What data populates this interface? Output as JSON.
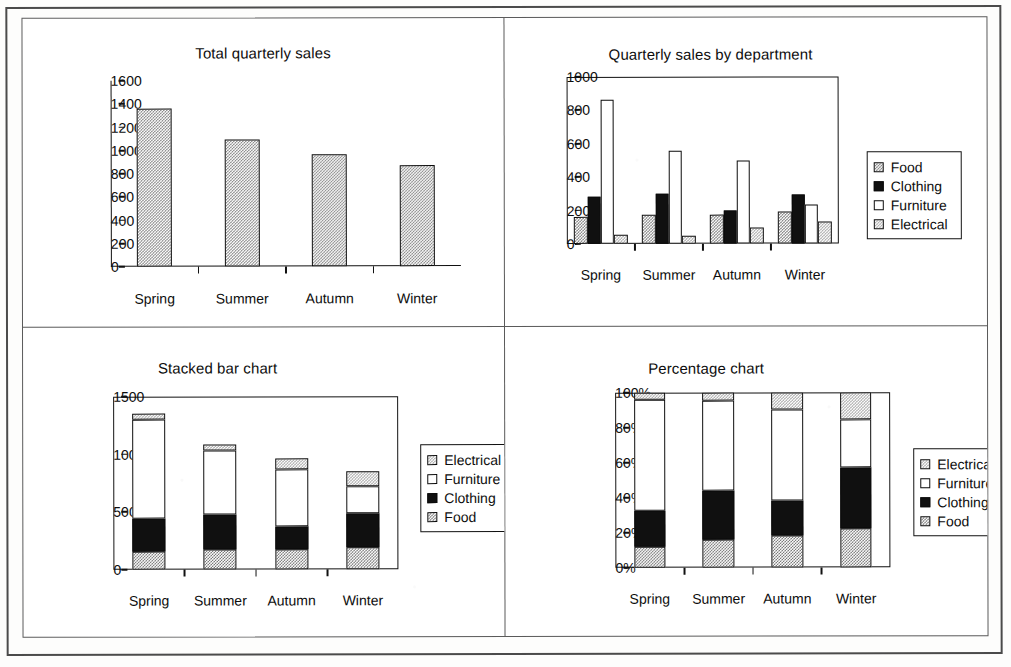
{
  "page": {
    "layout": "2x2 chart grid on scanned page",
    "categories": [
      "Spring",
      "Summer",
      "Autumn",
      "Winter"
    ],
    "series_names": [
      "Food",
      "Clothing",
      "Furniture",
      "Electrical"
    ],
    "colors": {
      "food": "#7a7a7a",
      "clothing": "#101010",
      "furniture": "#ffffff",
      "electrical": "#a8a8a8",
      "axis": "#111111",
      "frame": "#5a5a5a"
    }
  },
  "charts": {
    "total": {
      "title": "Total quarterly sales",
      "yticks": [
        "0",
        "200",
        "400",
        "600",
        "800",
        "1000",
        "1200",
        "1400",
        "1600"
      ],
      "xlabels": [
        "Spring",
        "Summer",
        "Autumn",
        "Winter"
      ]
    },
    "grouped": {
      "title": "Quarterly sales by department",
      "yticks": [
        "0",
        "200",
        "400",
        "600",
        "800",
        "1000"
      ],
      "xlabels": [
        "Spring",
        "Summer",
        "Autumn",
        "Winter"
      ],
      "legend": [
        "Food",
        "Clothing",
        "Furniture",
        "Electrical"
      ]
    },
    "stacked": {
      "title": "Stacked bar chart",
      "yticks": [
        "0",
        "500",
        "1000",
        "1500"
      ],
      "xlabels": [
        "Spring",
        "Summer",
        "Autumn",
        "Winter"
      ],
      "legend": [
        "Electrical",
        "Furniture",
        "Clothing",
        "Food"
      ]
    },
    "percentage": {
      "title": "Percentage chart",
      "yticks": [
        "0%",
        "20%",
        "40%",
        "60%",
        "80%",
        "100%"
      ],
      "xlabels": [
        "Spring",
        "Summer",
        "Autumn",
        "Winter"
      ],
      "legend": [
        "Electrical",
        "Furniture",
        "Clothing",
        "Food"
      ]
    }
  },
  "chart_data": [
    {
      "id": "total",
      "type": "bar",
      "title": "Total quarterly sales",
      "xlabel": "",
      "ylabel": "",
      "categories": [
        "Spring",
        "Summer",
        "Autumn",
        "Winter"
      ],
      "values": [
        1355,
        1090,
        965,
        865
      ],
      "ylim": [
        0,
        1600
      ],
      "ytick_step": 200,
      "grid": false,
      "legend": "none"
    },
    {
      "id": "grouped",
      "type": "bar",
      "title": "Quarterly sales by department",
      "xlabel": "",
      "ylabel": "",
      "categories": [
        "Spring",
        "Summer",
        "Autumn",
        "Winter"
      ],
      "series": [
        {
          "name": "Food",
          "values": [
            160,
            175,
            175,
            190
          ]
        },
        {
          "name": "Clothing",
          "values": [
            280,
            300,
            195,
            295
          ]
        },
        {
          "name": "Furniture",
          "values": [
            860,
            555,
            495,
            235
          ]
        },
        {
          "name": "Electrical",
          "values": [
            55,
            50,
            95,
            130
          ]
        }
      ],
      "ylim": [
        0,
        1000
      ],
      "ytick_step": 200,
      "grid": false,
      "legend": "right"
    },
    {
      "id": "stacked",
      "type": "bar",
      "stacked": true,
      "title": "Stacked bar chart",
      "xlabel": "",
      "ylabel": "",
      "categories": [
        "Spring",
        "Summer",
        "Autumn",
        "Winter"
      ],
      "series": [
        {
          "name": "Food",
          "values": [
            160,
            175,
            175,
            190
          ]
        },
        {
          "name": "Clothing",
          "values": [
            280,
            300,
            195,
            295
          ]
        },
        {
          "name": "Furniture",
          "values": [
            860,
            555,
            495,
            235
          ]
        },
        {
          "name": "Electrical",
          "values": [
            55,
            50,
            95,
            130
          ]
        }
      ],
      "totals": [
        1355,
        1080,
        960,
        850
      ],
      "ylim": [
        0,
        1500
      ],
      "ytick_step": 500,
      "grid": false,
      "legend": "right"
    },
    {
      "id": "percentage",
      "type": "bar",
      "stacked": true,
      "normalized": true,
      "title": "Percentage chart",
      "xlabel": "",
      "ylabel": "",
      "categories": [
        "Spring",
        "Summer",
        "Autumn",
        "Winter"
      ],
      "series": [
        {
          "name": "Food",
          "values": [
            11.8,
            16.2,
            18.2,
            22.3
          ]
        },
        {
          "name": "Clothing",
          "values": [
            20.6,
            27.8,
            20.3,
            34.7
          ]
        },
        {
          "name": "Furniture",
          "values": [
            63.5,
            51.4,
            51.6,
            27.6
          ]
        },
        {
          "name": "Electrical",
          "values": [
            4.1,
            4.6,
            9.9,
            15.4
          ]
        }
      ],
      "ylim": [
        0,
        100
      ],
      "ytick_step": 20,
      "grid": false,
      "legend": "right"
    }
  ]
}
